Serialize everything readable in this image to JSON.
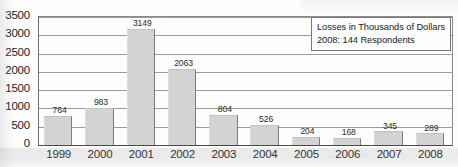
{
  "chart_data": {
    "type": "bar",
    "title": "",
    "xlabel": "",
    "ylabel": "",
    "categories": [
      "1999",
      "2000",
      "2001",
      "2002",
      "2003",
      "2004",
      "2005",
      "2006",
      "2007",
      "2008"
    ],
    "values": [
      764,
      983,
      3149,
      2063,
      804,
      526,
      204,
      168,
      345,
      289
    ],
    "value_labels": [
      "764",
      "983",
      "3149",
      "2063",
      "804",
      "526",
      "204",
      "168",
      "345",
      "289"
    ],
    "ylim": [
      0,
      3500
    ],
    "ytick_step": 500,
    "ytick_labels": [
      "0",
      "500",
      "1000",
      "1500",
      "2000",
      "2500",
      "3000",
      "3500"
    ],
    "grid": true,
    "grid_orientation": "horizontal",
    "legend_position": "top-right",
    "bar_color": "#d3d3d3",
    "annotations": [
      "Losses in Thousands of Dollars",
      "2008: 144 Respondents"
    ]
  },
  "legend": {
    "line1": "Losses in Thousands of Dollars",
    "line2": "2008: 144 Respondents"
  }
}
